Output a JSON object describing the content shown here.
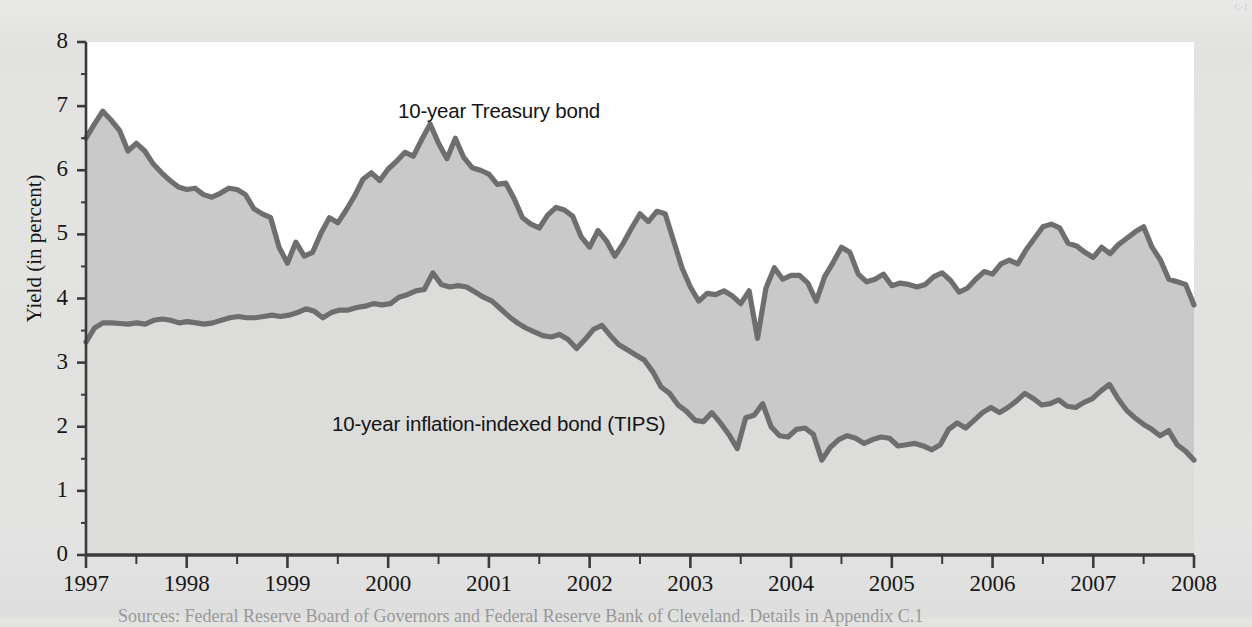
{
  "figure": {
    "background_color": "#e3e3e2",
    "plot_white_color": "#ffffff",
    "band_fill_color": "#c9c9c9",
    "lower_fill_color": "#dcdcdb",
    "line_color": "#6e6e6e",
    "axis_color": "#3b3b3b"
  },
  "labels": {
    "y_axis_title": "Yield (in percent)",
    "series_treasury": "10-year Treasury bond",
    "series_tips": "10-year inflation-indexed bond (TIPS)",
    "source_note": "Sources: Federal Reserve Board of Governors and Federal Reserve Bank of Cleveland. Details in Appendix C.1",
    "corner_marks": "C-1"
  },
  "chart_data": {
    "type": "line",
    "title": "",
    "xlabel": "",
    "ylabel": "Yield (in percent)",
    "xlim": [
      1997,
      2008
    ],
    "ylim": [
      0,
      8
    ],
    "ytick_labels": [
      "0",
      "1",
      "2",
      "3",
      "4",
      "5",
      "6",
      "7",
      "8"
    ],
    "yticks": [
      0,
      1,
      2,
      3,
      4,
      5,
      6,
      7,
      8
    ],
    "xtick_labels": [
      "1997",
      "1998",
      "1999",
      "2000",
      "2001",
      "2002",
      "2003",
      "2004",
      "2005",
      "2006",
      "2007",
      "2008"
    ],
    "xticks": [
      1997,
      1998,
      1999,
      2000,
      2001,
      2002,
      2003,
      2004,
      2005,
      2006,
      2007,
      2008
    ],
    "minor_xticks_per_year": 2,
    "grid": false,
    "legend_position": "inline-annotations",
    "fill_between_series": true,
    "series": [
      {
        "name": "10-year Treasury bond",
        "values": [
          6.5,
          6.72,
          6.92,
          6.78,
          6.62,
          6.3,
          6.42,
          6.3,
          6.1,
          5.96,
          5.84,
          5.74,
          5.7,
          5.72,
          5.62,
          5.58,
          5.64,
          5.72,
          5.7,
          5.62,
          5.4,
          5.32,
          5.26,
          4.8,
          4.55,
          4.88,
          4.66,
          4.72,
          5.02,
          5.26,
          5.18,
          5.38,
          5.6,
          5.86,
          5.96,
          5.84,
          6.02,
          6.14,
          6.28,
          6.22,
          6.48,
          6.72,
          6.42,
          6.18,
          6.5,
          6.2,
          6.04,
          6.0,
          5.94,
          5.78,
          5.8,
          5.56,
          5.26,
          5.16,
          5.1,
          5.3,
          5.42,
          5.38,
          5.28,
          4.96,
          4.8,
          5.06,
          4.9,
          4.66,
          4.86,
          5.1,
          5.32,
          5.2,
          5.36,
          5.32,
          4.9,
          4.48,
          4.18,
          3.96,
          4.08,
          4.06,
          4.12,
          4.04,
          3.92,
          4.12,
          3.38,
          4.16,
          4.48,
          4.3,
          4.36,
          4.36,
          4.24,
          3.96,
          4.34,
          4.56,
          4.8,
          4.72,
          4.38,
          4.26,
          4.3,
          4.38,
          4.2,
          4.24,
          4.22,
          4.18,
          4.22,
          4.34,
          4.4,
          4.28,
          4.1,
          4.16,
          4.3,
          4.42,
          4.38,
          4.54,
          4.6,
          4.54,
          4.76,
          4.94,
          5.12,
          5.16,
          5.1,
          4.86,
          4.82,
          4.72,
          4.64,
          4.8,
          4.7,
          4.84,
          4.94,
          5.04,
          5.12,
          4.8,
          4.6,
          4.3,
          4.26,
          4.22,
          3.9
        ]
      },
      {
        "name": "10-year inflation-indexed bond (TIPS)",
        "values": [
          3.32,
          3.54,
          3.62,
          3.62,
          3.61,
          3.6,
          3.62,
          3.6,
          3.66,
          3.68,
          3.66,
          3.62,
          3.64,
          3.62,
          3.6,
          3.62,
          3.66,
          3.7,
          3.72,
          3.7,
          3.7,
          3.72,
          3.74,
          3.72,
          3.74,
          3.78,
          3.84,
          3.8,
          3.7,
          3.78,
          3.82,
          3.82,
          3.86,
          3.88,
          3.92,
          3.9,
          3.92,
          4.02,
          4.06,
          4.12,
          4.14,
          4.4,
          4.22,
          4.18,
          4.2,
          4.18,
          4.1,
          4.02,
          3.96,
          3.84,
          3.72,
          3.62,
          3.54,
          3.48,
          3.42,
          3.4,
          3.44,
          3.36,
          3.22,
          3.36,
          3.52,
          3.58,
          3.42,
          3.28,
          3.2,
          3.12,
          3.04,
          2.86,
          2.62,
          2.52,
          2.34,
          2.24,
          2.1,
          2.08,
          2.22,
          2.06,
          1.88,
          1.66,
          2.14,
          2.18,
          2.36,
          2.0,
          1.86,
          1.84,
          1.96,
          1.98,
          1.88,
          1.48,
          1.68,
          1.8,
          1.86,
          1.82,
          1.74,
          1.8,
          1.84,
          1.82,
          1.7,
          1.72,
          1.74,
          1.7,
          1.64,
          1.72,
          1.96,
          2.06,
          1.98,
          2.1,
          2.22,
          2.3,
          2.22,
          2.3,
          2.4,
          2.52,
          2.44,
          2.34,
          2.36,
          2.42,
          2.32,
          2.3,
          2.38,
          2.44,
          2.56,
          2.66,
          2.44,
          2.26,
          2.14,
          2.04,
          1.96,
          1.86,
          1.94,
          1.72,
          1.62,
          1.48
        ]
      }
    ]
  },
  "geometry": {
    "plot_left": 86,
    "plot_right": 1194,
    "plot_top": 42,
    "plot_bottom": 555
  }
}
